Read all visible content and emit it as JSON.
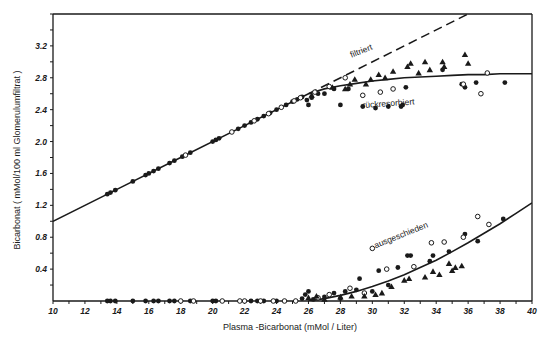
{
  "chart_data": {
    "type": "scatter",
    "title": "",
    "xlabel": "Plasma -Bicarbonat (mMol / Liter)",
    "ylabel": "Bicarbonat ( mMol/100 ml  Glomerulumfiltrat )",
    "xlim": [
      10,
      40
    ],
    "ylim": [
      0,
      3.6
    ],
    "xticks": [
      10,
      12,
      14,
      16,
      18,
      20,
      22,
      24,
      26,
      28,
      30,
      32,
      34,
      36,
      38,
      40
    ],
    "xtick_labels": [
      "10",
      "12",
      "14",
      "16",
      "18",
      "20",
      "22",
      "24",
      "26",
      "28",
      "30",
      "32",
      "34",
      "36",
      "38",
      "40"
    ],
    "yticks": [
      0.4,
      0.8,
      1.2,
      1.6,
      2.0,
      2.4,
      2.8,
      3.2
    ],
    "ytick_labels": [
      "0.4",
      "0.8",
      "1.2",
      "1.6",
      "2.0",
      "2.4",
      "2.8",
      "3.2"
    ],
    "grid": false,
    "legend": "none",
    "lines": [
      {
        "name": "filtriert",
        "style": "dashed",
        "x": [
          26,
          36.6
        ],
        "y": [
          2.6,
          3.66
        ]
      },
      {
        "name": "rückresorbiert",
        "style": "solid",
        "x": [
          10,
          14,
          18,
          22,
          26,
          27,
          28,
          29,
          30,
          31,
          32,
          33,
          34,
          35,
          36,
          37,
          38,
          39,
          40
        ],
        "y": [
          1.0,
          1.4,
          1.8,
          2.2,
          2.6,
          2.66,
          2.7,
          2.73,
          2.76,
          2.78,
          2.8,
          2.81,
          2.82,
          2.83,
          2.84,
          2.84,
          2.85,
          2.85,
          2.85
        ]
      },
      {
        "name": "ausgeschieden",
        "style": "solid",
        "x": [
          26,
          27,
          28,
          29,
          30,
          31,
          32,
          33,
          34,
          35,
          36,
          37,
          38,
          39,
          40
        ],
        "y": [
          0.0,
          0.03,
          0.07,
          0.12,
          0.18,
          0.25,
          0.33,
          0.42,
          0.51,
          0.62,
          0.73,
          0.85,
          0.97,
          1.1,
          1.23
        ]
      }
    ],
    "annotations": [
      {
        "text": "filtriert",
        "x": 28.7,
        "y": 3.05
      },
      {
        "text": "rückresorbiert",
        "x": 29.4,
        "y": 2.42
      },
      {
        "text": "ausgeschieden",
        "x": 30.2,
        "y": 0.66
      }
    ],
    "series": [
      {
        "name": "filled-circles",
        "marker": "filled-circle",
        "points": [
          [
            13.4,
            1.34
          ],
          [
            13.6,
            1.36
          ],
          [
            13.9,
            1.39
          ],
          [
            15.0,
            1.5
          ],
          [
            15.8,
            1.58
          ],
          [
            16.0,
            1.6
          ],
          [
            16.3,
            1.63
          ],
          [
            16.6,
            1.66
          ],
          [
            17.3,
            1.73
          ],
          [
            17.6,
            1.76
          ],
          [
            18.1,
            1.81
          ],
          [
            18.6,
            1.86
          ],
          [
            20.0,
            2.0
          ],
          [
            20.2,
            2.02
          ],
          [
            20.4,
            2.04
          ],
          [
            21.6,
            2.16
          ],
          [
            22.0,
            2.2
          ],
          [
            22.4,
            2.24
          ],
          [
            22.8,
            2.28
          ],
          [
            23.2,
            2.32
          ],
          [
            23.6,
            2.36
          ],
          [
            24.0,
            2.4
          ],
          [
            24.6,
            2.46
          ],
          [
            25.0,
            2.5
          ],
          [
            25.3,
            2.53
          ],
          [
            25.6,
            2.56
          ],
          [
            25.9,
            2.52
          ],
          [
            26.0,
            2.46
          ],
          [
            26.2,
            2.55
          ],
          [
            26.6,
            2.6
          ],
          [
            27.0,
            2.6
          ],
          [
            27.6,
            2.66
          ],
          [
            28.0,
            2.46
          ],
          [
            28.5,
            2.66
          ],
          [
            29.4,
            2.44
          ],
          [
            30.2,
            2.42
          ],
          [
            31.0,
            2.44
          ],
          [
            31.8,
            2.44
          ],
          [
            31.9,
            2.46
          ],
          [
            32.1,
            2.68
          ],
          [
            34.4,
            2.9
          ],
          [
            35.6,
            2.72
          ],
          [
            35.8,
            2.68
          ],
          [
            36.5,
            2.74
          ],
          [
            38.3,
            2.74
          ],
          [
            13.4,
            0.0
          ],
          [
            13.6,
            0.0
          ],
          [
            13.9,
            0.0
          ],
          [
            15.0,
            0.0
          ],
          [
            15.8,
            0.0
          ],
          [
            16.3,
            0.0
          ],
          [
            16.6,
            0.0
          ],
          [
            17.3,
            0.0
          ],
          [
            17.6,
            0.0
          ],
          [
            18.6,
            0.0
          ],
          [
            20.0,
            0.0
          ],
          [
            20.2,
            0.0
          ],
          [
            22.4,
            0.0
          ],
          [
            22.8,
            0.0
          ],
          [
            23.2,
            0.0
          ],
          [
            24.0,
            0.0
          ],
          [
            25.6,
            0.03
          ],
          [
            25.8,
            0.08
          ],
          [
            26.0,
            0.12
          ],
          [
            26.3,
            0.02
          ],
          [
            27.0,
            0.05
          ],
          [
            27.6,
            0.1
          ],
          [
            28.0,
            0.03
          ],
          [
            28.3,
            0.12
          ],
          [
            29.0,
            0.14
          ],
          [
            29.2,
            0.28
          ],
          [
            30.0,
            0.12
          ],
          [
            30.4,
            0.38
          ],
          [
            31.0,
            0.2
          ],
          [
            31.6,
            0.42
          ],
          [
            32.2,
            0.57
          ],
          [
            32.4,
            0.57
          ],
          [
            33.6,
            0.5
          ],
          [
            33.8,
            0.57
          ],
          [
            34.8,
            0.62
          ],
          [
            35.8,
            0.84
          ],
          [
            36.6,
            0.75
          ],
          [
            38.2,
            1.03
          ]
        ]
      },
      {
        "name": "open-circles",
        "marker": "open-circle",
        "points": [
          [
            18.3,
            1.83
          ],
          [
            21.2,
            2.12
          ],
          [
            22.6,
            2.26
          ],
          [
            23.5,
            2.35
          ],
          [
            24.3,
            2.43
          ],
          [
            25.1,
            2.51
          ],
          [
            25.5,
            2.55
          ],
          [
            26.4,
            2.62
          ],
          [
            27.3,
            2.69
          ],
          [
            28.3,
            2.8
          ],
          [
            29.4,
            2.58
          ],
          [
            30.5,
            2.62
          ],
          [
            31.3,
            2.66
          ],
          [
            35.7,
            2.72
          ],
          [
            37.2,
            2.86
          ],
          [
            36.8,
            2.6
          ],
          [
            18.0,
            0.0
          ],
          [
            18.8,
            0.0
          ],
          [
            20.6,
            0.0
          ],
          [
            21.7,
            0.0
          ],
          [
            22.0,
            0.0
          ],
          [
            23.0,
            0.0
          ],
          [
            23.8,
            0.0
          ],
          [
            24.5,
            0.0
          ],
          [
            25.2,
            0.0
          ],
          [
            26.6,
            0.04
          ],
          [
            27.3,
            0.08
          ],
          [
            28.6,
            0.16
          ],
          [
            29.5,
            0.1
          ],
          [
            30.0,
            0.66
          ],
          [
            30.9,
            0.4
          ],
          [
            32.6,
            0.43
          ],
          [
            33.7,
            0.73
          ],
          [
            34.5,
            0.74
          ],
          [
            35.7,
            0.8
          ],
          [
            36.6,
            1.06
          ],
          [
            37.3,
            0.96
          ]
        ]
      },
      {
        "name": "triangles",
        "marker": "filled-triangle",
        "points": [
          [
            26.2,
            2.58
          ],
          [
            27.5,
            2.68
          ],
          [
            28.3,
            2.66
          ],
          [
            28.6,
            2.72
          ],
          [
            28.9,
            2.78
          ],
          [
            29.6,
            2.72
          ],
          [
            29.9,
            2.78
          ],
          [
            30.4,
            2.84
          ],
          [
            30.8,
            2.8
          ],
          [
            31.3,
            2.88
          ],
          [
            32.2,
            2.94
          ],
          [
            32.4,
            2.98
          ],
          [
            32.9,
            2.86
          ],
          [
            33.3,
            3.0
          ],
          [
            33.6,
            2.9
          ],
          [
            34.4,
            3.0
          ],
          [
            34.5,
            2.94
          ],
          [
            35.8,
            3.09
          ],
          [
            36.0,
            2.98
          ],
          [
            26.0,
            0.04
          ],
          [
            26.5,
            0.06
          ],
          [
            27.0,
            0.02
          ],
          [
            28.0,
            0.05
          ],
          [
            28.7,
            0.06
          ],
          [
            29.5,
            0.06
          ],
          [
            30.2,
            0.08
          ],
          [
            30.6,
            0.1
          ],
          [
            31.2,
            0.18
          ],
          [
            32.0,
            0.26
          ],
          [
            32.3,
            0.28
          ],
          [
            33.3,
            0.3
          ],
          [
            33.8,
            0.37
          ],
          [
            34.2,
            0.33
          ],
          [
            34.8,
            0.47
          ],
          [
            35.0,
            0.38
          ],
          [
            35.2,
            0.42
          ],
          [
            35.6,
            0.44
          ]
        ]
      }
    ]
  }
}
